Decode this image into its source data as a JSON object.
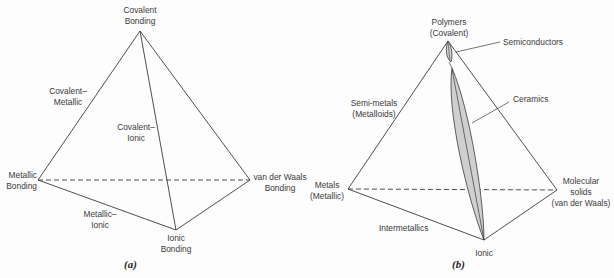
{
  "figure_a": {
    "caption": "(a)",
    "vertices": {
      "top": [
        "Covalent",
        "Bonding"
      ],
      "left": [
        "Metallic",
        "Bonding"
      ],
      "bottom": [
        "Ionic",
        "Bonding"
      ],
      "right": [
        "van der Waals",
        "Bonding"
      ]
    },
    "edge_labels": {
      "covalent_metallic": [
        "Covalent–",
        "Metallic"
      ],
      "covalent_ionic": [
        "Covalent–",
        "Ionic"
      ],
      "metallic_ionic": [
        "Metallic–",
        "Ionic"
      ]
    }
  },
  "figure_b": {
    "caption": "(b)",
    "vertices": {
      "top": [
        "Polymers",
        "(Covalent)"
      ],
      "left": [
        "Metals",
        "(Metallic)"
      ],
      "bottom": [
        "Ionic"
      ],
      "right": [
        "Molecular",
        "solids",
        "(van der Waals)"
      ]
    },
    "region_labels": {
      "semiconductors": "Semiconductors",
      "ceramics": "Ceramics",
      "semi_metals": [
        "Semi-metals",
        "(Metalloids)"
      ],
      "intermetallics": "Intermetallics"
    }
  },
  "colors": {
    "line": "#3a3a3a",
    "fill": "#cfcfcf",
    "text": "#3a3a3a"
  }
}
